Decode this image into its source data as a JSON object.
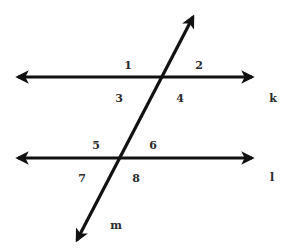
{
  "diagram": {
    "colors": {
      "line": "#111111",
      "label": "#2a2a2a",
      "background": "#ffffff"
    },
    "lines": [
      {
        "id": "k",
        "label": "k",
        "x1": 18,
        "y1": 77,
        "x2": 252,
        "y2": 77,
        "label_x": 273,
        "label_y": 102
      },
      {
        "id": "l",
        "label": "l",
        "x1": 18,
        "y1": 158,
        "x2": 252,
        "y2": 158,
        "label_x": 272,
        "label_y": 181
      },
      {
        "id": "m",
        "label": "m",
        "x1": 77,
        "y1": 240,
        "x2": 193,
        "y2": 17,
        "label_x": 116,
        "label_y": 229
      }
    ],
    "angles": [
      {
        "id": "1",
        "label": "1",
        "x": 128,
        "y": 69
      },
      {
        "id": "2",
        "label": "2",
        "x": 199,
        "y": 69
      },
      {
        "id": "3",
        "label": "3",
        "x": 119,
        "y": 102
      },
      {
        "id": "4",
        "label": "4",
        "x": 180,
        "y": 102
      },
      {
        "id": "5",
        "label": "5",
        "x": 96,
        "y": 149
      },
      {
        "id": "6",
        "label": "6",
        "x": 153,
        "y": 149
      },
      {
        "id": "7",
        "label": "7",
        "x": 82,
        "y": 182
      },
      {
        "id": "8",
        "label": "8",
        "x": 136,
        "y": 182
      }
    ]
  }
}
